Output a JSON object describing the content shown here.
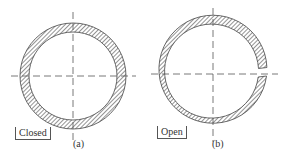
{
  "figure": {
    "panels": [
      {
        "id": "a",
        "label": "(a)",
        "state_label": "Closed",
        "shape": "closed ring"
      },
      {
        "id": "b",
        "label": "(b)",
        "state_label": "Open",
        "shape": "split ring with gap on right side"
      }
    ],
    "colors": {
      "stroke": "#444444",
      "hatch": "#666666",
      "background": "#ffffff"
    }
  }
}
